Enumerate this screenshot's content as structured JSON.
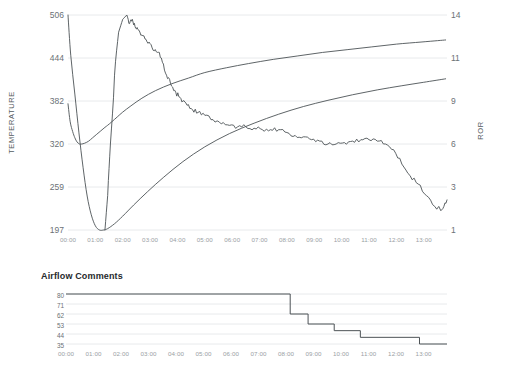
{
  "main": {
    "y_axis_left_label": "TEMPERATURE",
    "y_axis_right_label": "ROR",
    "y_ticks_left": [
      "506",
      "444",
      "382",
      "320",
      "259",
      "197"
    ],
    "y_ticks_right": [
      "14",
      "11",
      "9",
      "6",
      "3",
      "1"
    ],
    "x_ticks": [
      "00:00",
      "01:00",
      "02:00",
      "03:00",
      "04:00",
      "05:00",
      "06:00",
      "07:00",
      "08:00",
      "09:00",
      "10:00",
      "11:00",
      "12:00",
      "13:00"
    ]
  },
  "sub": {
    "title": "Airflow Comments",
    "y_ticks": [
      "80",
      "71",
      "62",
      "53",
      "44",
      "35"
    ],
    "x_ticks": [
      "00:00",
      "01:00",
      "02:00",
      "03:00",
      "04:00",
      "05:00",
      "06:00",
      "07:00",
      "08:00",
      "09:00",
      "10:00",
      "11:00",
      "12:00",
      "13:00"
    ]
  },
  "colors": {
    "curve": "#4c5256",
    "grid": "#e8eaec",
    "tick_text": "#6b7176",
    "axis_label": "#555b60",
    "title": "#26292b",
    "background": "#ffffff"
  },
  "chart_data": [
    {
      "type": "line",
      "title": "",
      "xlabel": "",
      "ylabel": "TEMPERATURE",
      "y2label": "ROR",
      "grid": true,
      "legend": "none",
      "xlim": [
        "00:00",
        "13:50"
      ],
      "ylim": [
        197,
        506
      ],
      "y2lim": [
        1,
        14
      ],
      "ytick_values": [
        506,
        444,
        382,
        320,
        259,
        197
      ],
      "y2tick_values": [
        14,
        11,
        9,
        6,
        3,
        1
      ],
      "xtick_labels": [
        "00:00",
        "01:00",
        "02:00",
        "03:00",
        "04:00",
        "05:00",
        "06:00",
        "07:00",
        "08:00",
        "09:00",
        "10:00",
        "11:00",
        "12:00",
        "13:00"
      ],
      "series": [
        {
          "name": "Bean Temperature",
          "axis": "left",
          "x": [
            0.0,
            0.08,
            0.17,
            0.25,
            0.33,
            0.42,
            0.5,
            0.6,
            0.75,
            0.9,
            1.05,
            1.2,
            1.35,
            1.45,
            1.6,
            1.8,
            2.0,
            2.3,
            2.7,
            3.2,
            3.8,
            4.4,
            5.0,
            5.8,
            6.6,
            7.5,
            8.4,
            9.3,
            10.2,
            11.1,
            12.0,
            12.9,
            13.5,
            13.8
          ],
          "y": [
            378,
            352,
            338,
            329,
            323,
            320,
            320,
            321,
            324,
            329,
            334,
            339,
            344,
            347,
            352,
            359,
            366,
            375,
            386,
            397,
            407,
            415,
            423,
            430,
            436,
            442,
            447,
            452,
            456,
            460,
            464,
            467,
            469,
            470
          ]
        },
        {
          "name": "Environmental Temperature",
          "axis": "left",
          "x": [
            0.0,
            0.1,
            0.25,
            0.4,
            0.55,
            0.7,
            0.85,
            1.0,
            1.15,
            1.3,
            1.45,
            1.7,
            2.0,
            2.4,
            2.9,
            3.5,
            4.2,
            5.0,
            5.9,
            6.8,
            7.7,
            8.6,
            9.5,
            10.4,
            11.3,
            12.2,
            13.0,
            13.8
          ],
          "y": [
            506,
            448,
            392,
            336,
            287,
            246,
            219,
            203,
            197,
            197,
            199,
            206,
            217,
            233,
            252,
            273,
            295,
            316,
            335,
            350,
            363,
            374,
            383,
            391,
            398,
            404,
            409,
            414
          ]
        },
        {
          "name": "Rate of Rise (ROR)",
          "axis": "right",
          "x": [
            1.35,
            1.45,
            1.55,
            1.7,
            1.85,
            2.0,
            2.15,
            2.25,
            2.35,
            2.45,
            2.55,
            2.7,
            2.85,
            3.0,
            3.15,
            3.3,
            3.45,
            3.6,
            3.75,
            3.9,
            4.05,
            4.2,
            4.35,
            4.55,
            4.75,
            5.0,
            5.3,
            5.6,
            5.9,
            6.2,
            6.5,
            6.8,
            7.1,
            7.4,
            7.7,
            8.0,
            8.3,
            8.6,
            8.9,
            9.2,
            9.5,
            9.8,
            10.1,
            10.4,
            10.7,
            11.0,
            11.3,
            11.6,
            11.9,
            12.2,
            12.5,
            12.8,
            13.1,
            13.4,
            13.7,
            13.85
          ],
          "y": [
            1.0,
            2.6,
            6.0,
            10.2,
            12.8,
            13.7,
            14.0,
            13.4,
            13.7,
            13.2,
            13.0,
            12.6,
            12.3,
            12.0,
            11.5,
            11.4,
            10.8,
            10.2,
            9.8,
            9.5,
            9.2,
            9.0,
            8.7,
            8.4,
            8.2,
            8.0,
            7.7,
            7.4,
            7.3,
            7.2,
            7.2,
            7.1,
            7.0,
            7.0,
            7.0,
            6.8,
            6.6,
            6.5,
            6.3,
            6.2,
            6.0,
            6.0,
            6.1,
            6.2,
            6.3,
            6.3,
            6.2,
            6.0,
            5.6,
            4.6,
            3.8,
            3.2,
            2.6,
            2.1,
            2.0,
            2.4
          ]
        }
      ]
    },
    {
      "type": "line",
      "title": "Airflow Comments",
      "xlabel": "",
      "ylabel": "",
      "grid": true,
      "legend": "none",
      "xlim": [
        "00:00",
        "13:50"
      ],
      "ylim": [
        35,
        80
      ],
      "ytick_values": [
        80,
        71,
        62,
        53,
        44,
        35
      ],
      "xtick_labels": [
        "00:00",
        "01:00",
        "02:00",
        "03:00",
        "04:00",
        "05:00",
        "06:00",
        "07:00",
        "08:00",
        "09:00",
        "10:00",
        "11:00",
        "12:00",
        "13:00"
      ],
      "step": "post",
      "series": [
        {
          "name": "Airflow",
          "x": [
            0.0,
            8.15,
            8.8,
            9.75,
            10.7,
            12.85,
            13.85
          ],
          "y": [
            80,
            62,
            53,
            47,
            41,
            35,
            35
          ]
        }
      ]
    }
  ]
}
